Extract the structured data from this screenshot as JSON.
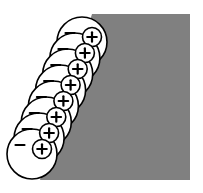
{
  "figure": {
    "caption": "",
    "width": 203,
    "height": 193,
    "background_color": "#ffffff"
  },
  "colors": {
    "background": "#ffffff",
    "slab_gray": "#808080",
    "outline_black": "#000000",
    "atom_fill_white": "#ffffff",
    "nucleus_fill_white": "#ffffff",
    "symbol_black": "#000000"
  },
  "slab": {
    "label": "solid-surface-slab",
    "fill": "#808080",
    "description": "gray rectangular solid with a diagonal front face",
    "polygon": "92,14 190,14 190,180 40,180",
    "top_y": 14,
    "bottom_y": 180,
    "right_x": 190,
    "bottom_left_x": 40,
    "top_left_x": 92
  },
  "atom_chain": {
    "label": "polarized-atom-chain",
    "count": 8,
    "orientation": "diagonal from upper-right to lower-left",
    "electron_cloud": {
      "radius": 25,
      "fill": "#ffffff",
      "stroke": "#000000",
      "stroke_width": 1.6
    },
    "nucleus": {
      "radius": 9.5,
      "fill": "#ffffff",
      "stroke": "#000000",
      "stroke_width": 1.6,
      "symbol": "+"
    },
    "negative_mark": {
      "symbol": "−",
      "stroke": "#000000"
    },
    "atoms": [
      {
        "index": 1,
        "cloud_cx": 82,
        "cloud_cy": 42,
        "nucleus_cx": 92,
        "nucleus_cy": 37,
        "charge_positive": "+",
        "charge_negative": "−",
        "minus_cx": 70,
        "minus_cy": 33
      },
      {
        "index": 2,
        "cloud_cx": 74.9,
        "cloud_cy": 58,
        "nucleus_cx": 84.9,
        "nucleus_cy": 53,
        "charge_positive": "+",
        "charge_negative": "−",
        "minus_cx": 62.9,
        "minus_cy": 49
      },
      {
        "index": 3,
        "cloud_cx": 67.7,
        "cloud_cy": 74,
        "nucleus_cx": 77.7,
        "nucleus_cy": 69,
        "charge_positive": "+",
        "charge_negative": "−",
        "minus_cx": 55.7,
        "minus_cy": 65
      },
      {
        "index": 4,
        "cloud_cx": 60.6,
        "cloud_cy": 90,
        "nucleus_cx": 70.6,
        "nucleus_cy": 85,
        "charge_positive": "+",
        "charge_negative": "−",
        "minus_cx": 48.6,
        "minus_cy": 81
      },
      {
        "index": 5,
        "cloud_cx": 53.4,
        "cloud_cy": 106,
        "nucleus_cx": 63.4,
        "nucleus_cy": 101,
        "charge_positive": "+",
        "charge_negative": "−",
        "minus_cx": 41.4,
        "minus_cy": 97
      },
      {
        "index": 6,
        "cloud_cx": 46.3,
        "cloud_cy": 122,
        "nucleus_cx": 56.3,
        "nucleus_cy": 117,
        "charge_positive": "+",
        "charge_negative": "−",
        "minus_cx": 34.3,
        "minus_cy": 113
      },
      {
        "index": 7,
        "cloud_cx": 39.1,
        "cloud_cy": 138,
        "nucleus_cx": 49.1,
        "nucleus_cy": 133,
        "charge_positive": "+",
        "charge_negative": "−",
        "minus_cx": 27.1,
        "minus_cy": 129
      },
      {
        "index": 8,
        "cloud_cx": 32,
        "cloud_cy": 154,
        "nucleus_cx": 42,
        "nucleus_cy": 149,
        "charge_positive": "+",
        "charge_negative": "−",
        "minus_cx": 20,
        "minus_cy": 145
      }
    ]
  },
  "alt_text": "Eight overlapping circles representing polarized atoms arranged diagonally, each containing a small circle marked with a plus sign and a minus sign to its upper left, layered over a gray rectangular slab."
}
